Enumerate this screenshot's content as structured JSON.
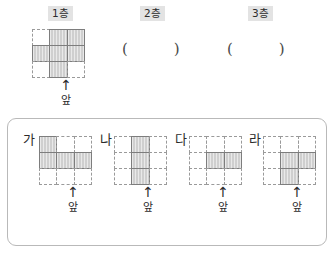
{
  "worksheet": {
    "title_hidden": "",
    "floors": [
      {
        "id": "floor-1",
        "label": "1층"
      },
      {
        "id": "floor-2",
        "label": "2층"
      },
      {
        "id": "floor-3",
        "label": "3층"
      }
    ],
    "answer_blanks": [
      {
        "id": "blank-floor-2",
        "open": "(",
        "close": ")",
        "value": ""
      },
      {
        "id": "blank-floor-3",
        "open": "(",
        "close": ")",
        "value": ""
      }
    ],
    "front_marker": {
      "arrow_glyph": "↑",
      "label": "앞"
    },
    "given_figure": {
      "name": "floor-1-figure",
      "rows": 3,
      "cols": 3,
      "filled": [
        [
          0,
          1,
          1
        ],
        [
          1,
          1,
          1
        ],
        [
          0,
          1,
          0
        ]
      ]
    },
    "options": [
      {
        "id": "option-ga",
        "label": "가",
        "rows": 3,
        "cols": 3,
        "filled": [
          [
            1,
            0,
            0
          ],
          [
            1,
            1,
            1
          ],
          [
            0,
            0,
            0
          ]
        ]
      },
      {
        "id": "option-na",
        "label": "나",
        "rows": 3,
        "cols": 3,
        "filled": [
          [
            0,
            1,
            0
          ],
          [
            0,
            1,
            0
          ],
          [
            0,
            1,
            0
          ]
        ]
      },
      {
        "id": "option-da",
        "label": "다",
        "rows": 3,
        "cols": 3,
        "filled": [
          [
            0,
            0,
            0
          ],
          [
            0,
            1,
            1
          ],
          [
            0,
            0,
            0
          ]
        ]
      },
      {
        "id": "option-ra",
        "label": "라",
        "rows": 3,
        "cols": 3,
        "filled": [
          [
            0,
            0,
            0
          ],
          [
            0,
            1,
            1
          ],
          [
            0,
            1,
            0
          ]
        ]
      }
    ],
    "colors": {
      "cell_fill": "#cfcfcf",
      "cell_stroke": "#7d7d7d",
      "grid_dash": "#9a9a9a",
      "label_bg": "#e3e3e3",
      "panel_border": "#b9b9b9",
      "text": "#2b2b2b"
    }
  }
}
